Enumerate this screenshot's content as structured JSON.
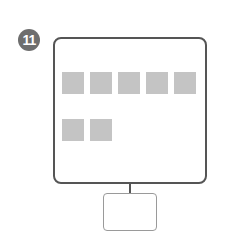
{
  "step_badge": {
    "number": "11",
    "color": "#6e6e6e"
  },
  "monitor": {
    "border_color": "#555555",
    "tile_color": "#c4c4c4"
  },
  "tiles": {
    "row1_count": 5,
    "row2_count": 2
  }
}
